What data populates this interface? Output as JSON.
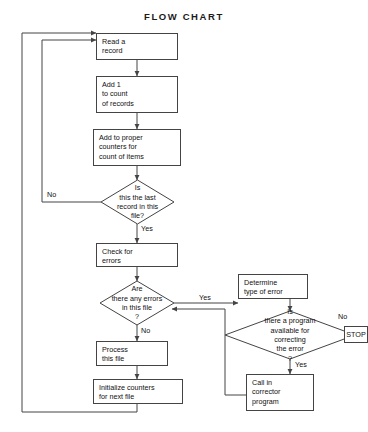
{
  "diagram": {
    "title": "FLOW  CHART",
    "line_color": "#444444",
    "text_color": "#111111",
    "background": "#ffffff"
  },
  "nodes": {
    "read_record": {
      "shape": "process",
      "lines": [
        "Read a",
        "record"
      ]
    },
    "add_one": {
      "shape": "process",
      "lines": [
        "Add 1",
        "to count",
        "of records"
      ]
    },
    "add_counters": {
      "shape": "process",
      "lines": [
        "Add to proper",
        "counters for",
        "count of items"
      ]
    },
    "last_record": {
      "shape": "decision",
      "lines": [
        "Is",
        "this the last",
        "record in this",
        "file?"
      ]
    },
    "check_errors": {
      "shape": "process",
      "lines": [
        "Check for",
        "errors"
      ]
    },
    "any_errors": {
      "shape": "decision",
      "lines": [
        "Are",
        "there any errors",
        "in this file",
        "?"
      ]
    },
    "process_file": {
      "shape": "process",
      "lines": [
        "Process",
        "this file"
      ]
    },
    "init_counters": {
      "shape": "process",
      "lines": [
        "Initialize counters",
        "for next file"
      ]
    },
    "determine_error": {
      "shape": "process",
      "lines": [
        "Determine",
        "type of error"
      ]
    },
    "program_available": {
      "shape": "decision",
      "lines": [
        "Is",
        "there a program",
        "available for",
        "correcting",
        "the error",
        "?"
      ]
    },
    "stop": {
      "shape": "terminal",
      "lines": [
        "STOP"
      ]
    },
    "call_corrector": {
      "shape": "process",
      "lines": [
        "Call in",
        "corrector",
        "program"
      ]
    }
  },
  "edge_labels": {
    "last_record_no": "No",
    "last_record_yes": "Yes",
    "any_errors_yes": "Yes",
    "any_errors_no": "No",
    "program_no": "No",
    "program_yes": "Yes"
  }
}
